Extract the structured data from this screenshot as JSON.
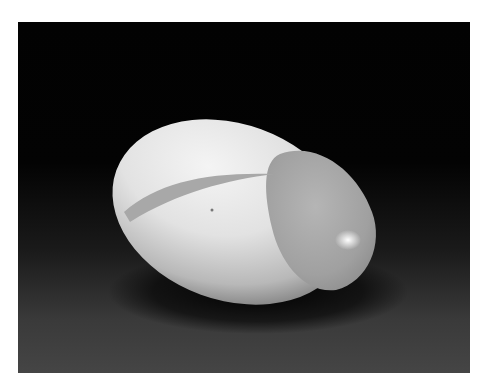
{
  "image": {
    "subject": "white egg-shaped sculpture with carved cavity",
    "background": "dark studio backdrop",
    "colors": {
      "frame": "#ffffff",
      "backdrop_top": "#020202",
      "backdrop_bottom": "#454545",
      "sculpture_light": "#f2f2f2",
      "sculpture_shadow": "#9a9a9a"
    }
  }
}
